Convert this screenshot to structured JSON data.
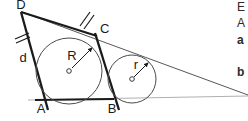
{
  "figure": {
    "colors": {
      "stroke_dark": "#1a1a1a",
      "stroke_thin": "#3a3a3a",
      "stroke_light": "#9a9a9a",
      "background": "#ffffff",
      "label": "#1a1a1a"
    },
    "vertices": [
      {
        "name": "D",
        "label": "D",
        "x": 21,
        "y": 9
      },
      {
        "name": "C",
        "label": "C",
        "x": 100,
        "y": 33
      },
      {
        "name": "A",
        "label": "A",
        "x": 41,
        "y": 113
      },
      {
        "name": "B",
        "label": "B",
        "x": 112,
        "y": 113
      }
    ],
    "side_labels": [
      {
        "name": "side-d",
        "label": "d",
        "x": 23,
        "y": 62
      }
    ],
    "circles": [
      {
        "name": "incircle",
        "label": "R",
        "label_x": 72,
        "label_y": 60,
        "cx": 69,
        "cy": 71,
        "radius": 33,
        "radius_arrow_to_x": 93,
        "radius_arrow_to_y": 47
      },
      {
        "name": "excircle",
        "label": "r",
        "label_x": 136,
        "label_y": 69,
        "cx": 132,
        "cy": 79,
        "radius": 24,
        "radius_arrow_to_x": 149,
        "radius_arrow_to_y": 62
      }
    ],
    "tick_marks": [
      {
        "name": "tick-on-DA",
        "x": 22,
        "y": 37,
        "angle": 118
      },
      {
        "name": "tick-on-DC",
        "x": 86,
        "y": 19,
        "angle": 68
      }
    ],
    "side_text": [
      {
        "name": "side-text-line-1",
        "label": "E",
        "x": 237,
        "y": 11
      },
      {
        "name": "side-text-line-2",
        "label": "A",
        "x": 237,
        "y": 27
      },
      {
        "name": "side-text-line-3",
        "label": "a",
        "x": 237,
        "y": 44
      },
      {
        "name": "side-text-line-4",
        "label": "b",
        "x": 237,
        "y": 76
      }
    ]
  }
}
